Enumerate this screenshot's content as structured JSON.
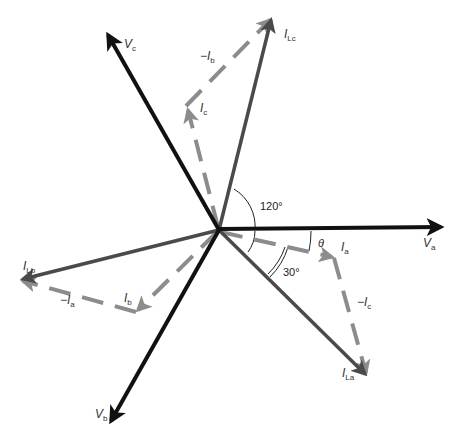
{
  "diagram": {
    "type": "phasor-diagram",
    "origin": [
      219,
      230
    ],
    "colors": {
      "voltage": "#111111",
      "line_current": "#4a4a4a",
      "phase_current": "#8c8c8c",
      "arc": "#222222",
      "label": "#333333"
    },
    "voltages": [
      {
        "id": "Va",
        "label_main": "V",
        "label_sub": "a",
        "tip": [
          444,
          227
        ]
      },
      {
        "id": "Vb",
        "label_main": "V",
        "label_sub": "b",
        "tip": [
          110,
          424
        ]
      },
      {
        "id": "Vc",
        "label_main": "V",
        "label_sub": "c",
        "tip": [
          106,
          32
        ]
      }
    ],
    "line_currents": [
      {
        "id": "ILa",
        "label_main": "I",
        "label_sub": "La",
        "tip": [
          367,
          376
        ]
      },
      {
        "id": "ILb",
        "label_main": "I",
        "label_sub": "Lb",
        "tip": [
          20,
          280
        ]
      },
      {
        "id": "ILc",
        "label_main": "I",
        "label_sub": "Lc",
        "tip": [
          272,
          17
        ]
      }
    ],
    "phase_currents": [
      {
        "id": "Ia",
        "label_main": "I",
        "label_sub": "a",
        "from": [
          219,
          230
        ],
        "to": [
          334,
          257
        ]
      },
      {
        "id": "Ib",
        "label_main": "I",
        "label_sub": "b",
        "from": [
          219,
          230
        ],
        "to": [
          136,
          312
        ]
      },
      {
        "id": "Ic",
        "label_main": "I",
        "label_sub": "c",
        "from": [
          219,
          230
        ],
        "to": [
          187,
          107
        ]
      }
    ],
    "negated_currents": [
      {
        "id": "-Ic",
        "label_main": "−I",
        "label_sub": "c",
        "from": [
          334,
          257
        ],
        "to": [
          367,
          376
        ]
      },
      {
        "id": "-Ia",
        "label_main": "−I",
        "label_sub": "a",
        "from": [
          136,
          312
        ],
        "to": [
          20,
          280
        ]
      },
      {
        "id": "-Ib",
        "label_main": "−I",
        "label_sub": "b",
        "from": [
          187,
          107
        ],
        "to": [
          272,
          17
        ]
      }
    ],
    "angles": [
      {
        "id": "angle-120",
        "label": "120°",
        "between": [
          "ILc",
          "Va"
        ]
      },
      {
        "id": "angle-30",
        "label": "30°",
        "between": [
          "Ia",
          "ILa"
        ]
      },
      {
        "id": "angle-theta",
        "label": "θ",
        "between": [
          "Va",
          "Ia"
        ]
      }
    ]
  }
}
